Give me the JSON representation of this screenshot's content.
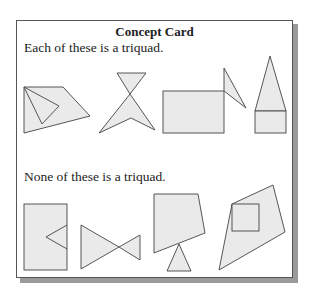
{
  "card": {
    "title": "Concept Card",
    "positive_label": "Each of these is a triquad.",
    "negative_label": "None of these is a triquad."
  },
  "colors": {
    "fill": "#eaeaea",
    "stroke": "#444444",
    "shadow": "#9a9a9a"
  },
  "examples": [
    {
      "group": "positive",
      "description": "quadrilateral with inner triangle"
    },
    {
      "group": "positive",
      "description": "hourglass of two triangles"
    },
    {
      "group": "positive",
      "description": "rectangle with attached triangle"
    },
    {
      "group": "positive",
      "description": "triangle atop rectangle"
    },
    {
      "group": "negative",
      "description": "rectangle with notch triangle"
    },
    {
      "group": "negative",
      "description": "bowtie of two triangles"
    },
    {
      "group": "negative",
      "description": "quadrilateral balanced on triangle"
    },
    {
      "group": "negative",
      "description": "quadrilateral with inner square"
    }
  ]
}
